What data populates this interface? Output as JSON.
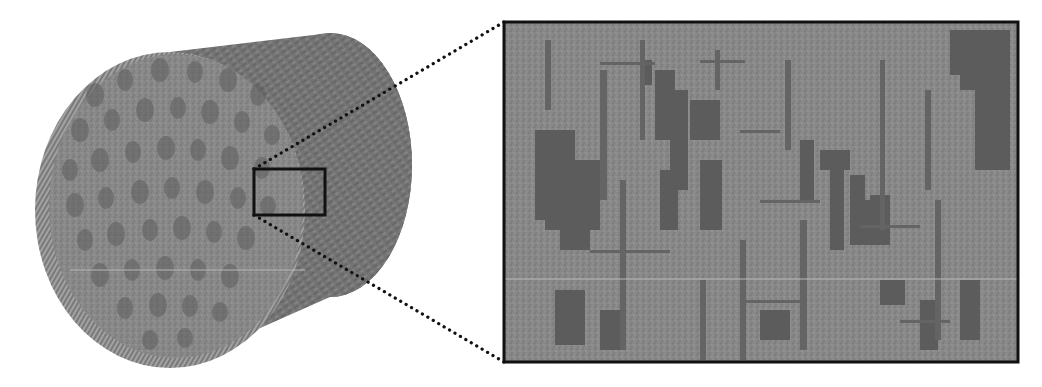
{
  "figure": {
    "canvas": {
      "width": 1042,
      "height": 387,
      "background": "#ffffff"
    },
    "colors": {
      "solid_light": "#8c8c8c",
      "solid_mid": "#7a7a7a",
      "pore_dark": "#5c5c5c",
      "body_side": "#777777",
      "edge_ridge": "#a0a0a0",
      "frame": "#111111",
      "connector": "#111111",
      "scan_line": "#b8b8b8"
    },
    "cylinder": {
      "front_face": {
        "cx": 170,
        "cy": 210,
        "rx": 135,
        "ry": 158
      },
      "back_face": {
        "cx": 330,
        "cy": 165,
        "rx": 82,
        "ry": 132
      },
      "pores": [
        [
          95,
          95,
          9,
          12
        ],
        [
          125,
          80,
          8,
          11
        ],
        [
          160,
          70,
          9,
          12
        ],
        [
          195,
          72,
          8,
          11
        ],
        [
          228,
          80,
          9,
          12
        ],
        [
          258,
          95,
          8,
          11
        ],
        [
          80,
          130,
          9,
          12
        ],
        [
          112,
          120,
          8,
          11
        ],
        [
          145,
          110,
          9,
          12
        ],
        [
          178,
          108,
          8,
          11
        ],
        [
          210,
          112,
          9,
          12
        ],
        [
          242,
          122,
          8,
          11
        ],
        [
          272,
          135,
          8,
          10
        ],
        [
          70,
          170,
          8,
          11
        ],
        [
          100,
          160,
          9,
          12
        ],
        [
          133,
          152,
          8,
          11
        ],
        [
          166,
          148,
          9,
          12
        ],
        [
          198,
          150,
          8,
          11
        ],
        [
          230,
          158,
          9,
          12
        ],
        [
          262,
          168,
          8,
          11
        ],
        [
          75,
          205,
          9,
          12
        ],
        [
          106,
          198,
          8,
          11
        ],
        [
          140,
          192,
          9,
          12
        ],
        [
          172,
          188,
          8,
          11
        ],
        [
          205,
          192,
          9,
          12
        ],
        [
          238,
          198,
          8,
          11
        ],
        [
          268,
          206,
          8,
          10
        ],
        [
          85,
          240,
          8,
          11
        ],
        [
          116,
          234,
          9,
          12
        ],
        [
          150,
          230,
          8,
          11
        ],
        [
          182,
          228,
          9,
          12
        ],
        [
          214,
          232,
          8,
          11
        ],
        [
          246,
          238,
          9,
          12
        ],
        [
          100,
          275,
          9,
          12
        ],
        [
          132,
          270,
          8,
          11
        ],
        [
          165,
          268,
          9,
          12
        ],
        [
          198,
          270,
          8,
          11
        ],
        [
          230,
          276,
          9,
          12
        ],
        [
          125,
          308,
          8,
          11
        ],
        [
          158,
          305,
          9,
          12
        ],
        [
          190,
          306,
          8,
          11
        ],
        [
          220,
          312,
          8,
          10
        ],
        [
          150,
          340,
          8,
          10
        ],
        [
          185,
          338,
          8,
          10
        ]
      ]
    },
    "selection_box": {
      "x": 254,
      "y": 169,
      "width": 71,
      "height": 46,
      "stroke_width": 3
    },
    "connectors": [
      {
        "from": [
          254,
          169
        ],
        "to": [
          504,
          22
        ]
      },
      {
        "from": [
          254,
          215
        ],
        "to": [
          504,
          362
        ]
      }
    ],
    "inset": {
      "x": 504,
      "y": 22,
      "width": 514,
      "height": 340,
      "stroke_width": 3,
      "dark_regions": [
        [
          535,
          130,
          40,
          90
        ],
        [
          545,
          160,
          55,
          70
        ],
        [
          560,
          210,
          30,
          40
        ],
        [
          655,
          70,
          20,
          70
        ],
        [
          670,
          90,
          18,
          100
        ],
        [
          690,
          100,
          30,
          40
        ],
        [
          700,
          160,
          22,
          70
        ],
        [
          660,
          170,
          18,
          60
        ],
        [
          640,
          60,
          12,
          25
        ],
        [
          800,
          140,
          14,
          60
        ],
        [
          820,
          150,
          30,
          20
        ],
        [
          830,
          170,
          14,
          80
        ],
        [
          850,
          175,
          15,
          70
        ],
        [
          855,
          200,
          35,
          45
        ],
        [
          870,
          195,
          20,
          30
        ],
        [
          950,
          30,
          60,
          45
        ],
        [
          960,
          70,
          50,
          20
        ],
        [
          975,
          90,
          35,
          80
        ],
        [
          555,
          290,
          30,
          55
        ],
        [
          600,
          310,
          20,
          40
        ],
        [
          760,
          310,
          30,
          30
        ],
        [
          880,
          280,
          25,
          25
        ],
        [
          920,
          300,
          18,
          50
        ],
        [
          960,
          280,
          20,
          60
        ]
      ],
      "vertical_streaks": [
        [
          545,
          40,
          6,
          70
        ],
        [
          600,
          70,
          7,
          130
        ],
        [
          640,
          40,
          5,
          100
        ],
        [
          715,
          50,
          5,
          40
        ],
        [
          785,
          60,
          6,
          90
        ],
        [
          800,
          220,
          7,
          130
        ],
        [
          880,
          60,
          5,
          170
        ],
        [
          925,
          90,
          6,
          100
        ],
        [
          935,
          200,
          6,
          140
        ],
        [
          620,
          180,
          6,
          170
        ],
        [
          740,
          240,
          6,
          120
        ],
        [
          700,
          280,
          6,
          80
        ]
      ],
      "horizontal_streaks": [
        [
          600,
          62,
          55,
          3
        ],
        [
          740,
          130,
          40,
          3
        ],
        [
          760,
          200,
          60,
          3
        ],
        [
          590,
          250,
          80,
          3
        ],
        [
          860,
          225,
          60,
          3
        ],
        [
          740,
          300,
          60,
          3
        ],
        [
          900,
          320,
          50,
          3
        ],
        [
          700,
          60,
          45,
          3
        ]
      ],
      "scan_line_y": 279
    },
    "scan_line_main": {
      "x1": 70,
      "x2": 305,
      "y": 270
    }
  }
}
